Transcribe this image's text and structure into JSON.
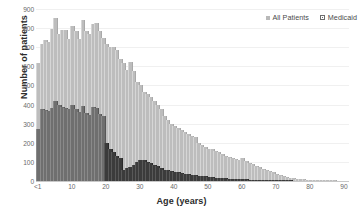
{
  "chart_data": {
    "type": "bar",
    "title": "",
    "subtitle": "",
    "xlabel": "Age (years)",
    "ylabel": "Number of patients",
    "xlim": [
      0,
      91
    ],
    "ylim": [
      0,
      900
    ],
    "grid": true,
    "legend_position": "top-right",
    "xtick_labels": [
      "<1",
      "10",
      "20",
      "30",
      "40",
      "50",
      "60",
      "70",
      "80",
      "90"
    ],
    "xtick_values": [
      0,
      10,
      20,
      30,
      40,
      50,
      60,
      70,
      80,
      90
    ],
    "ytick_labels": [
      "0",
      "100",
      "200",
      "300",
      "400",
      "500",
      "600",
      "700",
      "800",
      "900"
    ],
    "ytick_values": [
      0,
      100,
      200,
      300,
      400,
      500,
      600,
      700,
      800,
      900
    ],
    "x": [
      0,
      1,
      2,
      3,
      4,
      5,
      6,
      7,
      8,
      9,
      10,
      11,
      12,
      13,
      14,
      15,
      16,
      17,
      18,
      19,
      20,
      21,
      22,
      23,
      24,
      25,
      26,
      27,
      28,
      29,
      30,
      31,
      32,
      33,
      34,
      35,
      36,
      37,
      38,
      39,
      40,
      41,
      42,
      43,
      44,
      45,
      46,
      47,
      48,
      49,
      50,
      51,
      52,
      53,
      54,
      55,
      56,
      57,
      58,
      59,
      60,
      61,
      62,
      63,
      64,
      65,
      66,
      67,
      68,
      69,
      70,
      71,
      72,
      73,
      74,
      75,
      76,
      77,
      78,
      79,
      80,
      81,
      82,
      83,
      84,
      85,
      86,
      87,
      88,
      89,
      90
    ],
    "series": [
      {
        "name": "All Patients",
        "color": "#bdbdbd",
        "values": [
          620,
          718,
          737,
          730,
          793,
          855,
          770,
          792,
          790,
          742,
          813,
          783,
          745,
          843,
          785,
          770,
          820,
          828,
          783,
          750,
          715,
          700,
          700,
          688,
          640,
          620,
          580,
          622,
          575,
          520,
          500,
          465,
          455,
          440,
          420,
          400,
          375,
          340,
          320,
          300,
          290,
          275,
          265,
          255,
          245,
          235,
          230,
          200,
          190,
          180,
          170,
          165,
          155,
          150,
          140,
          130,
          125,
          120,
          115,
          110,
          118,
          105,
          95,
          88,
          80,
          72,
          65,
          58,
          52,
          45,
          38,
          32,
          27,
          22,
          18,
          15,
          12,
          10,
          8,
          6,
          5,
          4,
          3,
          2,
          2,
          1,
          1,
          1,
          0,
          0,
          0
        ]
      },
      {
        "name": "Medicaid",
        "color": "#6f6f6f",
        "values": [
          270,
          375,
          372,
          368,
          382,
          420,
          400,
          385,
          380,
          378,
          400,
          378,
          362,
          395,
          355,
          348,
          385,
          380,
          350,
          340,
          200,
          170,
          150,
          130,
          120,
          60,
          70,
          75,
          85,
          100,
          112,
          108,
          100,
          95,
          85,
          78,
          70,
          60,
          58,
          52,
          48,
          45,
          40,
          38,
          35,
          32,
          30,
          28,
          26,
          24,
          22,
          20,
          18,
          17,
          15,
          14,
          13,
          12,
          11,
          10,
          9,
          8,
          7,
          6,
          5,
          4,
          4,
          3,
          3,
          2,
          2,
          1,
          1,
          1,
          1,
          0,
          0,
          0,
          0,
          0,
          0,
          0,
          0,
          0,
          0,
          0,
          0,
          0,
          0,
          0,
          0
        ]
      }
    ]
  },
  "legend": {
    "entries": [
      {
        "label": "All Patients",
        "swatch": "all-patients-swatch"
      },
      {
        "label": "Medicaid",
        "swatch": "medicaid-swatch"
      }
    ]
  }
}
